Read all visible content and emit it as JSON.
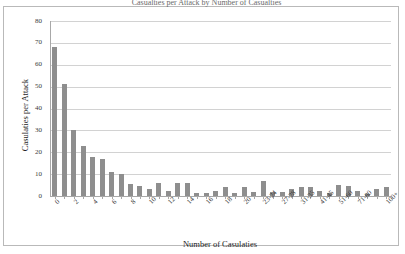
{
  "chart_data": {
    "type": "bar",
    "title": "Casualties per Attack by Number of Casualties",
    "xlabel": "Number of Casulaties",
    "ylabel": "Casulaties per Attack",
    "ylim": [
      0,
      80
    ],
    "ytick_values": [
      0,
      10,
      20,
      30,
      40,
      50,
      60,
      70,
      80
    ],
    "grid": true,
    "legend": "none",
    "bar_color": "#8e8e8e",
    "categories": [
      "0",
      "1",
      "2",
      "3",
      "4",
      "5",
      "6",
      "7",
      "8",
      "9",
      "10",
      "11",
      "12",
      "13",
      "14",
      "15",
      "16",
      "17",
      "18",
      "19",
      "20",
      "21-22",
      "23-24",
      "25-26",
      "27-28",
      "29-30",
      "31-35",
      "36-40",
      "41-45",
      "46-50",
      "51-60",
      "61-70",
      "71-80",
      "81-90",
      "91-100",
      "100+"
    ],
    "tick_labels": [
      "0",
      "",
      "2",
      "",
      "4",
      "",
      "6",
      "",
      "8",
      "",
      "10",
      "",
      "12",
      "",
      "14",
      "",
      "16",
      "",
      "18",
      "",
      "20",
      "",
      "23-24",
      "",
      "27-28",
      "",
      "31-35",
      "",
      "41-45",
      "",
      "51-60",
      "",
      "71-80",
      "",
      "",
      "100+"
    ],
    "values": [
      68,
      51,
      30,
      23,
      18,
      17,
      11,
      10,
      5.5,
      4.5,
      3,
      6,
      2.5,
      6,
      6,
      1.5,
      1.5,
      2.5,
      4,
      1.5,
      4,
      2,
      7,
      2,
      2,
      3,
      4,
      4,
      2.5,
      1.5,
      5,
      4.5,
      2.5,
      1,
      3,
      4
    ]
  }
}
